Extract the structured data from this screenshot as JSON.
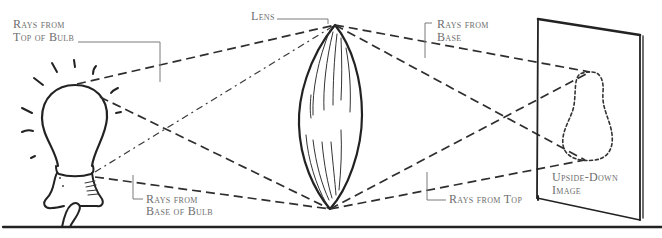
{
  "figure": {
    "labels": {
      "rays_top_of_bulb": {
        "line1": "Rays from",
        "line2": "Top of Bulb"
      },
      "lens": "Lens",
      "rays_from_base": {
        "line1": "Rays from",
        "line2": "Base"
      },
      "rays_base_of_bulb": {
        "line1": "Rays from",
        "line2": "Base of Bulb"
      },
      "rays_from_top": "Rays from Top",
      "upside_down_image": {
        "line1": "Upside-Down",
        "line2": "Image"
      }
    },
    "colors": {
      "ink": "#222222",
      "label": "#6e6e6e",
      "background": "#ffffff"
    }
  }
}
